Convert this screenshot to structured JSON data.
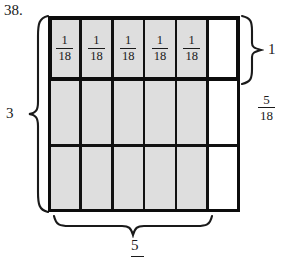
{
  "problem": {
    "number": "38."
  },
  "grid": {
    "columns": 6,
    "rows": 3,
    "shaded_columns": 5,
    "shaded_color": "#dedede",
    "unshaded_color": "#ffffff",
    "line_color": "#111111",
    "cells": [
      [
        {
          "shaded": true,
          "num": "1",
          "den": "18"
        },
        {
          "shaded": true,
          "num": "1",
          "den": "18"
        },
        {
          "shaded": true,
          "num": "1",
          "den": "18"
        },
        {
          "shaded": true,
          "num": "1",
          "den": "18"
        },
        {
          "shaded": true,
          "num": "1",
          "den": "18"
        },
        {
          "shaded": false,
          "num": "",
          "den": ""
        }
      ],
      [
        {
          "shaded": true,
          "num": "",
          "den": ""
        },
        {
          "shaded": true,
          "num": "",
          "den": ""
        },
        {
          "shaded": true,
          "num": "",
          "den": ""
        },
        {
          "shaded": true,
          "num": "",
          "den": ""
        },
        {
          "shaded": true,
          "num": "",
          "den": ""
        },
        {
          "shaded": false,
          "num": "",
          "den": ""
        }
      ],
      [
        {
          "shaded": true,
          "num": "",
          "den": ""
        },
        {
          "shaded": true,
          "num": "",
          "den": ""
        },
        {
          "shaded": true,
          "num": "",
          "den": ""
        },
        {
          "shaded": true,
          "num": "",
          "den": ""
        },
        {
          "shaded": true,
          "num": "",
          "den": ""
        },
        {
          "shaded": false,
          "num": "",
          "den": ""
        }
      ]
    ]
  },
  "labels": {
    "left_brace": "3",
    "right_brace": "1",
    "right_fraction": {
      "num": "5",
      "den": "18"
    },
    "bottom_brace": "5"
  }
}
